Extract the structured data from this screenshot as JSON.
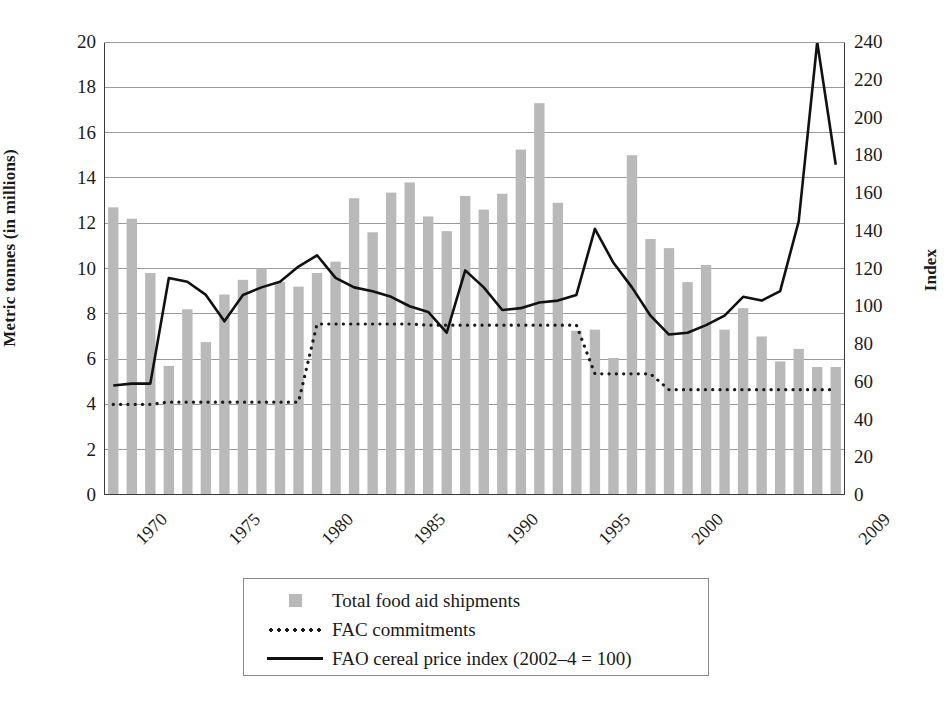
{
  "chart_data": {
    "type": "bar",
    "title": "",
    "xlabel": "",
    "ylabel": "Metric tonnes (in millions)",
    "y2label": "Index",
    "ylim": [
      0,
      20
    ],
    "y2lim": [
      0,
      240
    ],
    "grid": true,
    "legend_position": "bottom",
    "y_ticks": [
      "0",
      "2",
      "4",
      "6",
      "8",
      "10",
      "12",
      "14",
      "16",
      "18",
      "20"
    ],
    "y2_ticks": [
      "0",
      "20",
      "40",
      "60",
      "80",
      "100",
      "120",
      "140",
      "160",
      "180",
      "200",
      "220",
      "240"
    ],
    "x_tick_labels": [
      "1970",
      "1975",
      "1980",
      "1985",
      "1990",
      "1995",
      "2000",
      "2009"
    ],
    "x_tick_years": [
      1970,
      1975,
      1980,
      1985,
      1990,
      1995,
      2000,
      2009
    ],
    "categories": [
      1970,
      1971,
      1972,
      1973,
      1974,
      1975,
      1976,
      1977,
      1978,
      1979,
      1980,
      1981,
      1982,
      1983,
      1984,
      1985,
      1986,
      1987,
      1988,
      1989,
      1990,
      1991,
      1992,
      1993,
      1994,
      1995,
      1996,
      1997,
      1998,
      1999,
      2000,
      2001,
      2002,
      2003,
      2004,
      2005,
      2006,
      2007,
      2008,
      2009
    ],
    "series": [
      {
        "name": "Total food aid shipments",
        "type": "bar",
        "axis": "left",
        "unit": "million metric tonnes",
        "color": "#b9b9b9",
        "values": [
          12.7,
          12.2,
          9.8,
          5.7,
          8.2,
          6.75,
          8.85,
          9.5,
          10.0,
          9.4,
          9.2,
          9.8,
          10.3,
          13.1,
          11.6,
          13.35,
          13.8,
          12.3,
          11.65,
          13.2,
          12.6,
          13.3,
          15.25,
          17.3,
          12.9,
          7.25,
          7.3,
          6.05,
          15.0,
          11.3,
          10.9,
          9.4,
          10.15,
          7.3,
          8.25,
          7.0,
          5.9,
          6.45,
          5.65,
          5.65
        ]
      },
      {
        "name": "FAC commitments",
        "type": "line",
        "style": "dotted",
        "axis": "left",
        "unit": "million metric tonnes",
        "color": "#1a1a1a",
        "values": [
          4.0,
          4.0,
          4.0,
          4.1,
          4.1,
          4.1,
          4.1,
          4.1,
          4.1,
          4.1,
          4.1,
          7.55,
          7.55,
          7.55,
          7.55,
          7.55,
          7.55,
          7.5,
          7.5,
          7.5,
          7.5,
          7.5,
          7.5,
          7.5,
          7.5,
          7.5,
          5.35,
          5.35,
          5.35,
          5.35,
          4.65,
          4.65,
          4.65,
          4.65,
          4.65,
          4.65,
          4.65,
          4.65,
          4.65,
          4.65
        ]
      },
      {
        "name": "FAO cereal price index (2002–4 = 100)",
        "type": "line",
        "style": "solid",
        "axis": "right",
        "unit": "index (2002-4 = 100)",
        "color": "#111111",
        "values": [
          58,
          59,
          59,
          115,
          113,
          106,
          92,
          106,
          110,
          113,
          121,
          127,
          115,
          110,
          108,
          105,
          100,
          97,
          86,
          119,
          110,
          98,
          99,
          102,
          103,
          106,
          141,
          123,
          110,
          95,
          85,
          86,
          90,
          95,
          105,
          103,
          108,
          145,
          240,
          175
        ]
      }
    ],
    "legend": [
      {
        "label": "Total food aid shipments",
        "key": "bar-swatch"
      },
      {
        "label": "FAC commitments",
        "key": "dotted-line-swatch"
      },
      {
        "label": "FAO cereal price index (2002–4 = 100)",
        "key": "solid-line-swatch"
      }
    ]
  },
  "colors": {
    "bar": "#b9b9b9",
    "line": "#111111",
    "grid": "#9b9b9b",
    "axis": "#3a3a3a",
    "text": "#1a1a1a"
  }
}
